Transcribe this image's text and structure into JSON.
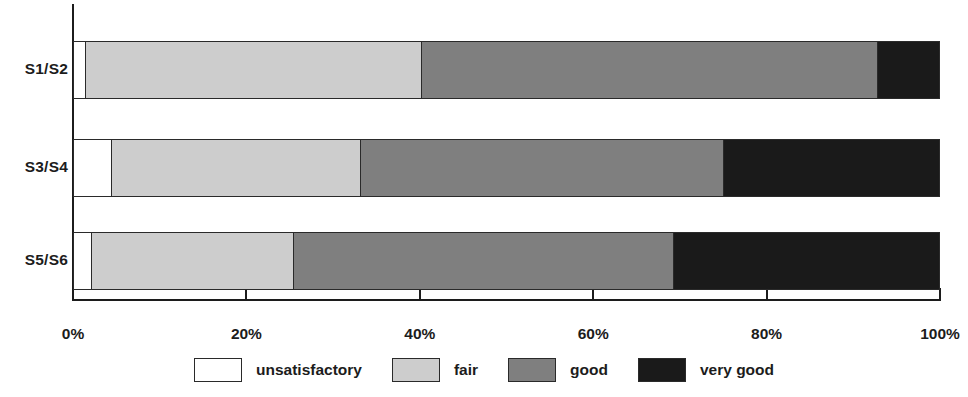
{
  "chart_data": {
    "type": "bar",
    "orientation": "horizontal",
    "stacked": true,
    "normalized": true,
    "title": "",
    "subtitle": "",
    "xlabel": "",
    "ylabel": "",
    "categories": [
      "S1/S2",
      "S3/S4",
      "S5/S6"
    ],
    "series": [
      {
        "name": "unsatisfactory",
        "color": "#ffffff",
        "values": [
          1.3,
          4.3,
          2.0
        ]
      },
      {
        "name": "fair",
        "color": "#cdcdcd",
        "values": [
          38.8,
          28.8,
          23.3
        ]
      },
      {
        "name": "good",
        "color": "#7f7f7f",
        "values": [
          52.7,
          41.9,
          43.9
        ]
      },
      {
        "name": "very good",
        "color": "#1a1a1a",
        "values": [
          7.2,
          25.0,
          30.8
        ]
      }
    ],
    "xlim": [
      0,
      100
    ],
    "xticks": [
      0,
      20,
      40,
      60,
      80,
      100
    ],
    "xtick_labels": [
      "0%",
      "20%",
      "40%",
      "60%",
      "80%",
      "100%"
    ],
    "grid": false,
    "legend_position": "bottom",
    "legend_entries": [
      "unsatisfactory",
      "fair",
      "good",
      "very good"
    ]
  },
  "axis": {
    "tick_labels": [
      "0%",
      "20%",
      "40%",
      "60%",
      "80%",
      "100%"
    ]
  },
  "legend": {
    "entries": [
      {
        "label": "unsatisfactory",
        "color": "#ffffff"
      },
      {
        "label": "fair",
        "color": "#cdcdcd"
      },
      {
        "label": "good",
        "color": "#7f7f7f"
      },
      {
        "label": "very good",
        "color": "#1a1a1a"
      }
    ]
  },
  "colors": {
    "unsatisfactory": "#ffffff",
    "fair": "#cdcdcd",
    "good": "#7f7f7f",
    "very_good": "#1a1a1a",
    "axis": "#1c1c1c",
    "text": "#1c1c1c",
    "background": "#ffffff"
  }
}
